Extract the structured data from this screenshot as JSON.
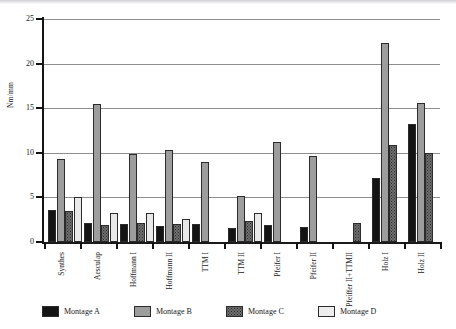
{
  "chart_data": {
    "type": "bar",
    "title": "",
    "xlabel": "",
    "ylabel": "Nm/mm",
    "ylim": [
      0,
      25
    ],
    "yticks": [
      0,
      5,
      10,
      15,
      20,
      25
    ],
    "grid": true,
    "legend_position": "bottom",
    "categories": [
      "Synthes",
      "Aesculap",
      "Hoffmann I",
      "Hoffmann II",
      "TTM I",
      "TTM II",
      "Pfeifer I",
      "Pfeifer II",
      "Pfeiffer II+TTMII",
      "Holz I",
      "Holz II"
    ],
    "series": [
      {
        "name": "Montage A",
        "color": "#141414",
        "values": [
          3.6,
          2.1,
          2.0,
          1.8,
          2.0,
          1.6,
          1.9,
          1.7,
          0,
          7.2,
          13.2
        ]
      },
      {
        "name": "Montage B",
        "color": "#9d9d9d",
        "values": [
          9.3,
          15.5,
          9.9,
          10.3,
          9.0,
          5.2,
          11.2,
          9.6,
          0,
          22.3,
          15.6
        ]
      },
      {
        "name": "Montage C",
        "color": "#6f6f6f",
        "values": [
          3.5,
          1.9,
          2.1,
          2.0,
          0,
          2.4,
          0,
          0,
          2.1,
          10.9,
          10.0
        ]
      },
      {
        "name": "Montage D",
        "color": "#e9e9e9",
        "values": [
          5.0,
          3.3,
          3.3,
          2.6,
          0,
          3.2,
          0,
          0,
          0,
          0,
          0
        ]
      }
    ]
  },
  "legend": {
    "items": [
      {
        "label": "Montage A"
      },
      {
        "label": "Montage B"
      },
      {
        "label": "Montage C"
      },
      {
        "label": "Montage D"
      }
    ]
  }
}
